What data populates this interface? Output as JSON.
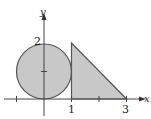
{
  "diagram": {
    "axes": {
      "x_label": "x",
      "y_label": "y",
      "origin_px": [
        44,
        99
      ],
      "unit_px": 27.5
    },
    "tick_labels": {
      "x_1": "1",
      "x_3": "3",
      "y_2": "2"
    },
    "shapes": [
      {
        "type": "circle",
        "center": [
          0,
          1
        ],
        "radius": 1,
        "fill": "#c8c8c8",
        "stroke": "#555555"
      },
      {
        "type": "triangle",
        "vertices": [
          [
            1,
            0
          ],
          [
            1,
            2
          ],
          [
            3,
            0
          ]
        ],
        "fill": "#c8c8c8",
        "stroke": "#555555"
      }
    ],
    "colors": {
      "fill": "#c8c8c8",
      "stroke": "#555555",
      "axis": "#444444"
    }
  }
}
